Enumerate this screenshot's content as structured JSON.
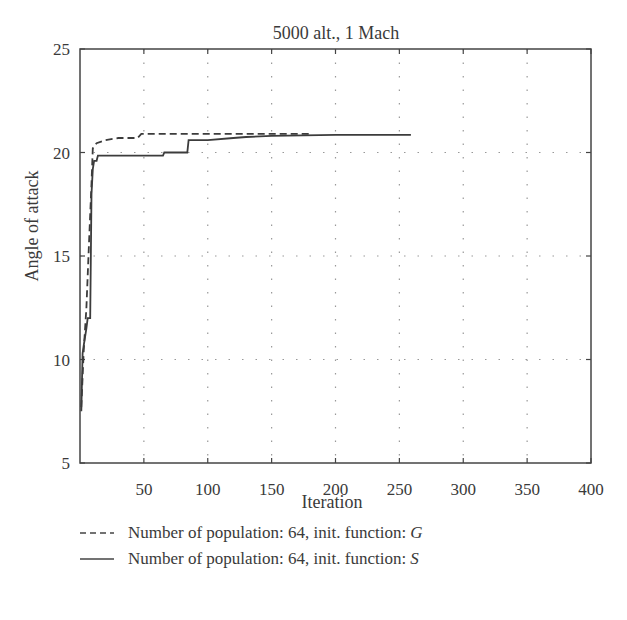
{
  "chart_data": {
    "type": "line",
    "title": "5000 alt., 1 Mach",
    "xlabel": "Iteration",
    "ylabel": "Angle of attack",
    "xlim": [
      0,
      400
    ],
    "ylim": [
      5,
      25
    ],
    "xticks": [
      50,
      100,
      150,
      200,
      250,
      300,
      350,
      400
    ],
    "yticks": [
      5,
      10,
      15,
      20,
      25
    ],
    "grid": "dotted",
    "legend_position": "below",
    "series": [
      {
        "name": "Number of population: 64, init. function: G",
        "style": "dashed",
        "x": [
          1,
          3,
          5,
          7,
          9,
          10,
          13,
          20,
          30,
          45,
          48,
          60,
          100,
          150,
          180
        ],
        "y": [
          7.7,
          10.5,
          12.5,
          15.5,
          18.5,
          20.2,
          20.45,
          20.6,
          20.7,
          20.7,
          20.9,
          20.9,
          20.9,
          20.9,
          20.9
        ]
      },
      {
        "name": "Number of population: 64, init. function: S",
        "style": "solid",
        "x": [
          1,
          2,
          3,
          5,
          6,
          8,
          9,
          10,
          11,
          13,
          14,
          20,
          40,
          65,
          66,
          84,
          85,
          100,
          120,
          130,
          150,
          200,
          259
        ],
        "y": [
          7.5,
          10.3,
          10.7,
          11.5,
          12.0,
          12.0,
          18.0,
          19.2,
          19.6,
          19.6,
          19.85,
          19.85,
          19.85,
          19.85,
          20.0,
          20.0,
          20.6,
          20.6,
          20.7,
          20.75,
          20.8,
          20.85,
          20.85
        ]
      }
    ]
  },
  "legend": {
    "items": [
      {
        "label": "Number of population: 64, init. function: ",
        "func": "G"
      },
      {
        "label": "Number of population: 64, init. function: ",
        "func": "S"
      }
    ]
  }
}
